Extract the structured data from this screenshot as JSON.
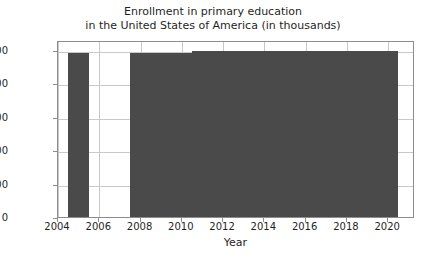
{
  "chart_data": {
    "type": "bar",
    "title": "Enrollment in primary education\nin the United States of America (in thousands)",
    "xlabel": "Year",
    "ylabel": "",
    "xlim": [
      2004.0,
      2021.3
    ],
    "ylim": [
      0,
      26500
    ],
    "grid": true,
    "legend": null,
    "bar_color": "#4a4a4a",
    "xticks": [
      2004,
      2006,
      2008,
      2010,
      2012,
      2014,
      2016,
      2018,
      2020
    ],
    "xtick_labels": [
      "2004",
      "2006",
      "2008",
      "2010",
      "2012",
      "2014",
      "2016",
      "2018",
      "2020"
    ],
    "yticks": [
      0,
      5000,
      10000,
      15000,
      20000,
      25000
    ],
    "ytick_labels": [
      "0",
      "5000",
      "10000",
      "15000",
      "20000",
      "25000"
    ],
    "categories": [
      2005,
      2008,
      2009,
      2010,
      2011,
      2012,
      2013,
      2014,
      2015,
      2016,
      2017,
      2018,
      2019,
      2020
    ],
    "values": [
      24600,
      24500,
      24500,
      24550,
      24800,
      24850,
      24850,
      24850,
      24850,
      24850,
      24850,
      24850,
      24850,
      24850
    ],
    "missing_years": [
      2004,
      2006,
      2007,
      2021
    ]
  }
}
